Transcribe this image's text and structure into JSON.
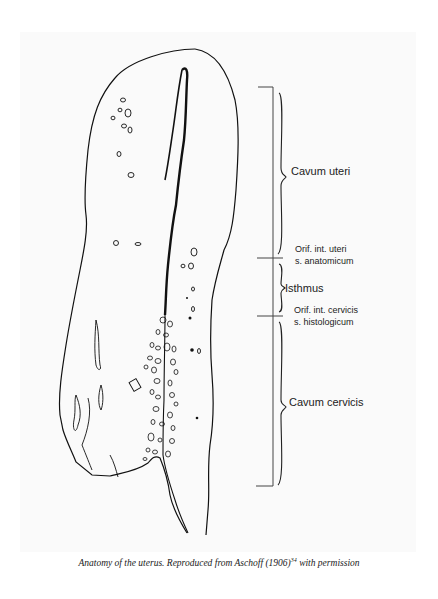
{
  "figure": {
    "labels": {
      "cavum_uteri": "Cavum uteri",
      "orif_int_uteri_line1": "Orif. int. uteri",
      "orif_int_uteri_line2": "s. anatomicum",
      "isthmus": "Isthmus",
      "orif_int_cervicis_line1": "Orif. int. cervicis",
      "orif_int_cervicis_line2": "s. histologicum",
      "cavum_cervicis": "Cavum cervicis"
    },
    "caption": {
      "text": "Anatomy of the uterus. Reproduced from Aschoff (1906)",
      "reference": "34",
      "suffix": " with permission"
    },
    "colors": {
      "line": "#111111",
      "bracket": "#444444",
      "panel": "#fafafa"
    }
  }
}
